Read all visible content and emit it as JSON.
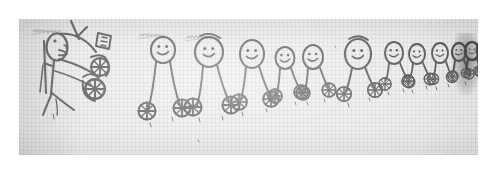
{
  "image": {
    "kind": "scanned-pencil-drawing",
    "medium": "pencil on graph paper",
    "scan_border_color": "#ffffff",
    "paper_color": "#e9e9e7",
    "pencil_color": "#3a3a3c",
    "width": 497,
    "height": 173,
    "caption": "Child's pencil drawing: a row of smiling stick figures on wheels receding toward the right, with one larger figure at the left"
  },
  "annotations": {
    "label_left": "handwritten label",
    "label_mid_1": "handwritten label",
    "label_mid_2": "handwritten label",
    "tiny_marks": [
      "e",
      "r",
      "c",
      "e",
      "r",
      "c",
      "u",
      "u",
      "m"
    ]
  },
  "figures": [
    {
      "id": "figure-1-large",
      "role": "large-figure-with-flag",
      "head_cx": 57,
      "head_cy": 47,
      "head_rx": 11,
      "head_ry": 14,
      "scale": 1.0
    },
    {
      "id": "figure-2",
      "role": "stick-figure-on-wheels",
      "head_cx": 163,
      "head_cy": 50,
      "head_rx": 12,
      "head_ry": 13,
      "scale": 0.95
    },
    {
      "id": "figure-3",
      "role": "stick-figure-on-wheels",
      "head_cx": 208,
      "head_cy": 52,
      "head_rx": 14,
      "head_ry": 15,
      "scale": 1.0
    },
    {
      "id": "figure-4",
      "role": "stick-figure-on-wheels",
      "head_cx": 252,
      "head_cy": 54,
      "head_rx": 12,
      "head_ry": 14,
      "scale": 0.9
    },
    {
      "id": "figure-5",
      "role": "stick-figure-on-wheels",
      "head_cx": 286,
      "head_cy": 58,
      "head_rx": 9,
      "head_ry": 11,
      "scale": 0.78
    },
    {
      "id": "figure-6",
      "role": "stick-figure-on-wheels",
      "head_cx": 314,
      "head_cy": 57,
      "head_rx": 10,
      "head_ry": 12,
      "scale": 0.8
    },
    {
      "id": "figure-7",
      "role": "stick-figure-on-wheels",
      "head_cx": 358,
      "head_cy": 54,
      "head_rx": 13,
      "head_ry": 15,
      "scale": 0.95
    },
    {
      "id": "figure-8",
      "role": "stick-figure-on-wheels",
      "head_cx": 394,
      "head_cy": 53,
      "head_rx": 9,
      "head_ry": 11,
      "scale": 0.72
    },
    {
      "id": "figure-9",
      "role": "stick-figure-on-wheels",
      "head_cx": 417,
      "head_cy": 54,
      "head_rx": 8,
      "head_ry": 10,
      "scale": 0.66
    },
    {
      "id": "figure-10",
      "role": "stick-figure-on-wheels",
      "head_cx": 440,
      "head_cy": 53,
      "head_rx": 8,
      "head_ry": 10,
      "scale": 0.64
    },
    {
      "id": "figure-11",
      "role": "stick-figure-on-wheels-dark",
      "head_cx": 460,
      "head_cy": 52,
      "head_rx": 7,
      "head_ry": 9,
      "scale": 0.58
    },
    {
      "id": "figure-12",
      "role": "stick-figure-on-wheels-dark",
      "head_cx": 474,
      "head_cy": 52,
      "head_rx": 7,
      "head_ry": 9,
      "scale": 0.55
    },
    {
      "id": "figure-13",
      "role": "stick-figure-on-wheels-dark",
      "head_cx": 486,
      "head_cy": 51,
      "head_rx": 6,
      "head_ry": 8,
      "scale": 0.5
    }
  ],
  "figure_count_visible": 13,
  "wheel_count_visible": 22
}
